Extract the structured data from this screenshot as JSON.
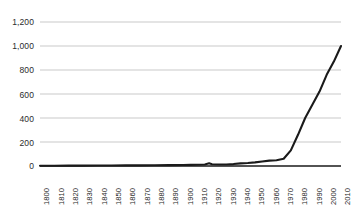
{
  "chart_data": {
    "type": "line",
    "title": "",
    "subtitle": "",
    "xlabel": "",
    "ylabel": "",
    "xlim": [
      1800,
      2010
    ],
    "ylim": [
      0,
      1200
    ],
    "grid": true,
    "legend": null,
    "y_ticks": [
      "0",
      "200",
      "400",
      "600",
      "800",
      "1,000",
      "1,200"
    ],
    "y_tick_values": [
      0,
      200,
      400,
      600,
      800,
      1000,
      1200
    ],
    "x_ticks": [
      "1800",
      "1810",
      "1820",
      "1830",
      "1840",
      "1850",
      "1860",
      "1870",
      "1880",
      "1890",
      "1900",
      "1910",
      "1920",
      "1930",
      "1940",
      "1950",
      "1960",
      "1970",
      "1980",
      "1990",
      "2000",
      "2010"
    ],
    "series": [
      {
        "name": "",
        "color": "#1a1a1a",
        "x": [
          1800,
          1810,
          1820,
          1830,
          1840,
          1850,
          1860,
          1870,
          1880,
          1890,
          1900,
          1905,
          1910,
          1915,
          1918,
          1920,
          1925,
          1930,
          1935,
          1940,
          1945,
          1950,
          1955,
          1960,
          1965,
          1970,
          1975,
          1980,
          1985,
          1990,
          1995,
          2000,
          2005,
          2010
        ],
        "values": [
          2,
          2,
          3,
          3,
          4,
          4,
          5,
          5,
          6,
          7,
          8,
          9,
          10,
          12,
          22,
          14,
          13,
          13,
          16,
          22,
          25,
          30,
          38,
          45,
          48,
          60,
          130,
          260,
          400,
          510,
          620,
          760,
          870,
          1000
        ]
      }
    ]
  },
  "axes": {
    "baseline_color": "#1a1a1a",
    "gridline_color": "#c9c9c9",
    "background": "#ffffff"
  }
}
